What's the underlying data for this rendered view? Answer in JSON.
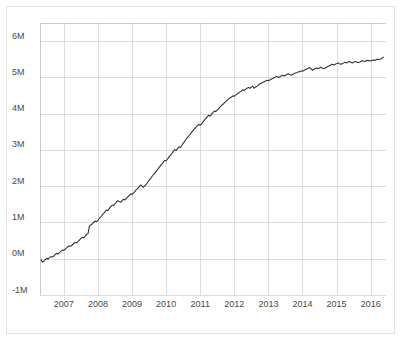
{
  "chart_data": {
    "type": "line",
    "title": "",
    "subtitle": "",
    "xlabel": "",
    "ylabel": "",
    "grid": true,
    "legend": false,
    "legend_position": "none",
    "line_color": "#333333",
    "grid_color": "#cfcfcf",
    "background_color": "#ffffff",
    "xlim": [
      2006.3,
      2016.45
    ],
    "ylim": [
      -1000000,
      6500000
    ],
    "ytick_values": [
      -1000000,
      0,
      1000000,
      2000000,
      3000000,
      4000000,
      5000000,
      6000000
    ],
    "ytick_labels": [
      "-1M",
      "0M",
      "1M",
      "2M",
      "3M",
      "4M",
      "5M",
      "6M"
    ],
    "xtick_values": [
      2007,
      2008,
      2009,
      2010,
      2011,
      2012,
      2013,
      2014,
      2015,
      2016
    ],
    "xtick_labels": [
      "2007",
      "2008",
      "2009",
      "2010",
      "2011",
      "2012",
      "2013",
      "2014",
      "2015",
      "2016"
    ],
    "series": [
      {
        "name": "cumulative-total",
        "color": "#333333",
        "x": [
          2006.33,
          2006.37,
          2006.42,
          2006.46,
          2006.5,
          2006.54,
          2006.58,
          2006.62,
          2006.67,
          2006.71,
          2006.75,
          2006.79,
          2006.83,
          2006.87,
          2006.92,
          2006.96,
          2007.0,
          2007.04,
          2007.08,
          2007.12,
          2007.17,
          2007.21,
          2007.25,
          2007.29,
          2007.33,
          2007.37,
          2007.42,
          2007.46,
          2007.5,
          2007.54,
          2007.58,
          2007.62,
          2007.67,
          2007.71,
          2007.75,
          2007.79,
          2007.83,
          2007.87,
          2007.92,
          2007.96,
          2008.0,
          2008.04,
          2008.08,
          2008.12,
          2008.17,
          2008.21,
          2008.25,
          2008.29,
          2008.33,
          2008.37,
          2008.42,
          2008.46,
          2008.5,
          2008.54,
          2008.58,
          2008.62,
          2008.67,
          2008.71,
          2008.75,
          2008.79,
          2008.83,
          2008.87,
          2008.92,
          2008.96,
          2009.0,
          2009.04,
          2009.08,
          2009.12,
          2009.17,
          2009.21,
          2009.25,
          2009.29,
          2009.33,
          2009.37,
          2009.42,
          2009.46,
          2009.5,
          2009.54,
          2009.58,
          2009.62,
          2009.67,
          2009.71,
          2009.75,
          2009.79,
          2009.83,
          2009.87,
          2009.92,
          2009.96,
          2010.0,
          2010.04,
          2010.08,
          2010.12,
          2010.17,
          2010.21,
          2010.25,
          2010.29,
          2010.33,
          2010.37,
          2010.42,
          2010.46,
          2010.5,
          2010.54,
          2010.58,
          2010.62,
          2010.67,
          2010.71,
          2010.75,
          2010.79,
          2010.83,
          2010.87,
          2010.92,
          2010.96,
          2011.0,
          2011.04,
          2011.08,
          2011.12,
          2011.17,
          2011.21,
          2011.25,
          2011.29,
          2011.33,
          2011.37,
          2011.42,
          2011.46,
          2011.5,
          2011.54,
          2011.58,
          2011.62,
          2011.67,
          2011.71,
          2011.75,
          2011.79,
          2011.83,
          2011.87,
          2011.92,
          2011.96,
          2012.0,
          2012.04,
          2012.08,
          2012.12,
          2012.17,
          2012.21,
          2012.25,
          2012.29,
          2012.33,
          2012.37,
          2012.42,
          2012.46,
          2012.5,
          2012.54,
          2012.58,
          2012.62,
          2012.67,
          2012.71,
          2012.75,
          2012.79,
          2012.83,
          2012.87,
          2012.92,
          2012.96,
          2013.0,
          2013.04,
          2013.08,
          2013.12,
          2013.17,
          2013.21,
          2013.25,
          2013.29,
          2013.33,
          2013.37,
          2013.42,
          2013.46,
          2013.5,
          2013.54,
          2013.58,
          2013.62,
          2013.67,
          2013.71,
          2013.75,
          2013.79,
          2013.83,
          2013.87,
          2013.92,
          2013.96,
          2014.0,
          2014.04,
          2014.08,
          2014.12,
          2014.17,
          2014.21,
          2014.25,
          2014.29,
          2014.33,
          2014.37,
          2014.42,
          2014.46,
          2014.5,
          2014.54,
          2014.58,
          2014.62,
          2014.67,
          2014.71,
          2014.75,
          2014.79,
          2014.83,
          2014.87,
          2014.92,
          2014.96,
          2015.0,
          2015.04,
          2015.08,
          2015.12,
          2015.17,
          2015.21,
          2015.25,
          2015.29,
          2015.33,
          2015.37,
          2015.42,
          2015.46,
          2015.5,
          2015.54,
          2015.58,
          2015.62,
          2015.67,
          2015.71,
          2015.75,
          2015.79,
          2015.83,
          2015.87,
          2015.92,
          2015.96,
          2016.0,
          2016.04,
          2016.08,
          2016.12,
          2016.17,
          2016.21,
          2016.25,
          2016.29,
          2016.33,
          2016.37
        ],
        "values": [
          -30000,
          -95000,
          -60000,
          -20000,
          10000,
          -5000,
          30000,
          60000,
          45000,
          80000,
          120000,
          150000,
          130000,
          170000,
          210000,
          240000,
          230000,
          265000,
          300000,
          330000,
          360000,
          345000,
          385000,
          420000,
          450000,
          440000,
          480000,
          520000,
          560000,
          590000,
          575000,
          620000,
          670000,
          700000,
          900000,
          930000,
          960000,
          1000000,
          1040000,
          1020000,
          1060000,
          1110000,
          1150000,
          1200000,
          1250000,
          1300000,
          1340000,
          1330000,
          1380000,
          1430000,
          1480000,
          1470000,
          1510000,
          1560000,
          1600000,
          1580000,
          1560000,
          1600000,
          1640000,
          1620000,
          1660000,
          1700000,
          1750000,
          1790000,
          1770000,
          1810000,
          1850000,
          1900000,
          1940000,
          1990000,
          2030000,
          2010000,
          1970000,
          2010000,
          2060000,
          2110000,
          2160000,
          2210000,
          2260000,
          2310000,
          2360000,
          2410000,
          2460000,
          2510000,
          2560000,
          2610000,
          2660000,
          2710000,
          2700000,
          2750000,
          2800000,
          2850000,
          2900000,
          2960000,
          3010000,
          2980000,
          3030000,
          3080000,
          3070000,
          3120000,
          3180000,
          3230000,
          3290000,
          3340000,
          3390000,
          3440000,
          3490000,
          3530000,
          3580000,
          3620000,
          3670000,
          3700000,
          3680000,
          3720000,
          3770000,
          3820000,
          3870000,
          3920000,
          3960000,
          3930000,
          3980000,
          4030000,
          4070000,
          4060000,
          4100000,
          4140000,
          4180000,
          4220000,
          4260000,
          4300000,
          4340000,
          4370000,
          4400000,
          4430000,
          4460000,
          4490000,
          4480000,
          4510000,
          4540000,
          4570000,
          4600000,
          4630000,
          4660000,
          4640000,
          4670000,
          4700000,
          4720000,
          4700000,
          4730000,
          4760000,
          4700000,
          4730000,
          4760000,
          4790000,
          4820000,
          4840000,
          4860000,
          4880000,
          4900000,
          4920000,
          4910000,
          4930000,
          4950000,
          4970000,
          4990000,
          5010000,
          5030000,
          5000000,
          5020000,
          5040000,
          5060000,
          5040000,
          5060000,
          5080000,
          5100000,
          5080000,
          5060000,
          5080000,
          5100000,
          5120000,
          5130000,
          5150000,
          5160000,
          5180000,
          5170000,
          5190000,
          5210000,
          5230000,
          5250000,
          5270000,
          5240000,
          5200000,
          5220000,
          5240000,
          5260000,
          5240000,
          5260000,
          5280000,
          5260000,
          5240000,
          5260000,
          5280000,
          5300000,
          5320000,
          5340000,
          5360000,
          5340000,
          5360000,
          5380000,
          5400000,
          5380000,
          5360000,
          5380000,
          5400000,
          5420000,
          5400000,
          5420000,
          5440000,
          5420000,
          5400000,
          5420000,
          5440000,
          5430000,
          5410000,
          5420000,
          5440000,
          5460000,
          5450000,
          5440000,
          5460000,
          5470000,
          5460000,
          5450000,
          5470000,
          5480000,
          5470000,
          5490000,
          5500000,
          5490000,
          5510000,
          5530000,
          5560000
        ]
      }
    ]
  },
  "axes": {
    "y_label_text": "",
    "x_label_text": ""
  }
}
